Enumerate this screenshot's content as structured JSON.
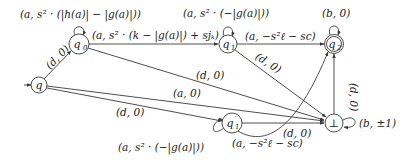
{
  "diagram": {
    "type": "automaton",
    "nodes": [
      {
        "id": "q",
        "label": "q",
        "initial": true,
        "accepting": false
      },
      {
        "id": "q0",
        "label": "q₀",
        "initial": false,
        "accepting": false
      },
      {
        "id": "q1",
        "label": "q₁",
        "initial": false,
        "accepting": false
      },
      {
        "id": "q2",
        "label": "q₂",
        "initial": false,
        "accepting": true
      },
      {
        "id": "q1p",
        "label": "q′₁",
        "initial": false,
        "accepting": false
      },
      {
        "id": "bot",
        "label": "⊥",
        "initial": false,
        "accepting": false
      }
    ],
    "edges": [
      {
        "from": "q",
        "to": "q0",
        "label": "(d, 0)"
      },
      {
        "from": "q0",
        "to": "q0",
        "label": "(a, s² · (|h(a)| − |g(a)|))"
      },
      {
        "from": "q0",
        "to": "q1",
        "label": "(a, s² · (k − |g(a)|) + sjₖ)"
      },
      {
        "from": "q0",
        "to": "bot",
        "label": "(d, 0)"
      },
      {
        "from": "q1",
        "to": "q1",
        "label": "(a, s² · (−|g(a)|))"
      },
      {
        "from": "q1",
        "to": "q2",
        "label": "(a, −s²ℓ − sc)"
      },
      {
        "from": "q1",
        "to": "bot",
        "label": "(d, 0)"
      },
      {
        "from": "q2",
        "to": "q2",
        "label": "(b, 0)"
      },
      {
        "from": "q",
        "to": "bot",
        "label": "(a, 0)"
      },
      {
        "from": "q",
        "to": "q1p",
        "label": "(d, 0)"
      },
      {
        "from": "q1p",
        "to": "q1p",
        "label": "(a, s² · (−|g(a)|))"
      },
      {
        "from": "q1p",
        "to": "q2",
        "label": "(a, −s²ℓ − sc)"
      },
      {
        "from": "q1p",
        "to": "bot",
        "label": "(d, 0)"
      },
      {
        "from": "bot",
        "to": "q2",
        "label": "(d, 0)"
      },
      {
        "from": "bot",
        "to": "bot",
        "label": "(b, ±1)"
      }
    ]
  },
  "labels": {
    "node_q": "q",
    "node_q0": "q",
    "node_q0_sub": "0",
    "node_q1": "q",
    "node_q1_sub": "1",
    "node_q2": "q",
    "node_q2_sub": "2",
    "node_q1p": "q",
    "node_q1p_sub": "1",
    "node_q1p_prime": "′",
    "node_bot": "⊥",
    "e_q_q0": "(d, 0)",
    "e_q0_loop": "(a, s² · (|h(a)| − |g(a)|))",
    "e_q0_q1": "(a, s² · (k − |g(a)|) + sjₖ)",
    "e_q0_bot": "(d, 0)",
    "e_q1_loop": "(a, s² · (−|g(a)|))",
    "e_q1_q2": "(a, −s²ℓ − sc)",
    "e_q1_bot": "(d, 0)",
    "e_q2_loop": "(b, 0)",
    "e_q_bot": "(a, 0)",
    "e_q_q1p": "(d, 0)",
    "e_q1p_loop": "(a, s² · (−|g(a)|))",
    "e_q1p_q2": "(a, −s²ℓ − sc)",
    "e_q1p_bot": "(d, 0)",
    "e_bot_q2": "(d, 0)",
    "e_bot_loop": "(b, ±1)"
  }
}
